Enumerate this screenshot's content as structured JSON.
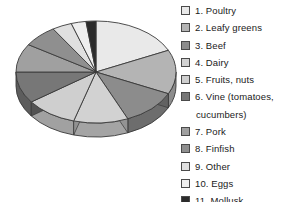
{
  "chart_data": {
    "type": "pie",
    "title": "",
    "subtitle": "",
    "xlabel": "",
    "ylabel": "",
    "three_d": true,
    "start_angle_deg": 0,
    "direction": "clockwise",
    "legend_position": "right",
    "grid": false,
    "categories": [
      "1. Poultry",
      "2. Leafy greens",
      "3. Beef",
      "4. Dairy",
      "5. Fruits, nuts",
      "6. Vine (tomatoes, cucumbers)",
      "7. Pork",
      "8. Finfish",
      "9. Other",
      "10. Eggs",
      "11. Mollusk"
    ],
    "values": [
      18.0,
      14.0,
      11.5,
      11.0,
      10.5,
      10.0,
      9.0,
      7.0,
      4.0,
      3.0,
      2.0
    ],
    "colors": [
      "#e9e9e9",
      "#b4b4b4",
      "#8c8c8c",
      "#d2d2d2",
      "#cfcfcf",
      "#777777",
      "#a0a0a0",
      "#8f8f8f",
      "#e0e0e0",
      "#efefef",
      "#2b2b2b"
    ],
    "slice_outline_color": "#3a3a3a",
    "background_color": "#ffffff"
  },
  "legend": {
    "items": [
      {
        "label": "1. Poultry",
        "color": "#e9e9e9",
        "swatch_name": "legend-swatch-poultry"
      },
      {
        "label": "2. Leafy greens",
        "color": "#b4b4b4",
        "swatch_name": "legend-swatch-leafy-greens"
      },
      {
        "label": "3. Beef",
        "color": "#8c8c8c",
        "swatch_name": "legend-swatch-beef"
      },
      {
        "label": "4. Dairy",
        "color": "#d2d2d2",
        "swatch_name": "legend-swatch-dairy"
      },
      {
        "label": "5. Fruits, nuts",
        "color": "#cfcfcf",
        "swatch_name": "legend-swatch-fruits-nuts"
      },
      {
        "label": "6. Vine (tomatoes,",
        "color": "#777777",
        "swatch_name": "legend-swatch-vine",
        "continuation": "cucumbers)"
      },
      {
        "label": "7. Pork",
        "color": "#a0a0a0",
        "swatch_name": "legend-swatch-pork"
      },
      {
        "label": "8. Finfish",
        "color": "#8f8f8f",
        "swatch_name": "legend-swatch-finfish"
      },
      {
        "label": "9. Other",
        "color": "#e0e0e0",
        "swatch_name": "legend-swatch-other"
      },
      {
        "label": "10. Eggs",
        "color": "#efefef",
        "swatch_name": "legend-swatch-eggs"
      },
      {
        "label": "11. Mollusk",
        "color": "#2b2b2b",
        "swatch_name": "legend-swatch-mollusk"
      }
    ]
  }
}
